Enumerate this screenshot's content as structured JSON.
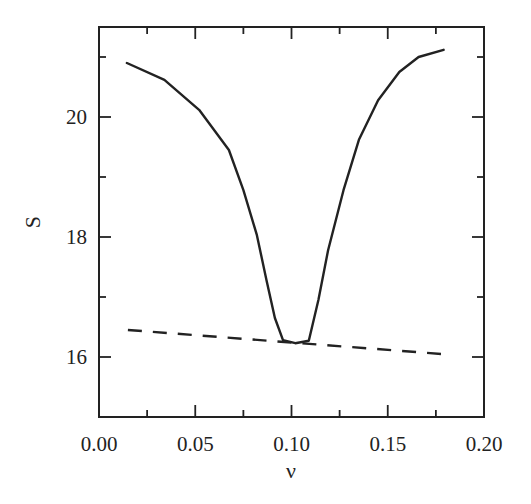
{
  "chart_data": {
    "type": "line",
    "title": "",
    "xlabel": "ν",
    "ylabel": "S",
    "xlim": [
      0.0,
      0.2
    ],
    "ylim": [
      15.0,
      21.5
    ],
    "x_ticks_major": [
      0.0,
      0.05,
      0.1,
      0.15,
      0.2
    ],
    "x_tick_labels": [
      "0.00",
      "0.05",
      "0.10",
      "0.15",
      "0.20"
    ],
    "x_ticks_minor": [
      0.025,
      0.075,
      0.125,
      0.175
    ],
    "y_ticks_major": [
      16,
      18,
      20
    ],
    "y_tick_labels": [
      "16",
      "18",
      "20"
    ],
    "y_ticks_minor": [
      17,
      19,
      21
    ],
    "grid": false,
    "legend": null,
    "series": [
      {
        "name": "solid curve",
        "style": "solid",
        "x": [
          0.0145,
          0.034,
          0.052,
          0.0675,
          0.075,
          0.082,
          0.087,
          0.0914,
          0.0956,
          0.102,
          0.109,
          0.114,
          0.119,
          0.127,
          0.135,
          0.145,
          0.156,
          0.166,
          0.179
        ],
        "y": [
          20.9,
          20.62,
          20.12,
          19.45,
          18.78,
          18.03,
          17.28,
          16.65,
          16.28,
          16.23,
          16.27,
          16.95,
          17.78,
          18.78,
          19.62,
          20.28,
          20.75,
          21.0,
          21.12
        ]
      },
      {
        "name": "dashed line",
        "style": "dashed",
        "x": [
          0.015,
          0.178
        ],
        "y": [
          16.45,
          16.05
        ]
      }
    ]
  },
  "layout": {
    "plot_left": 99,
    "plot_right": 484,
    "plot_top": 27,
    "plot_bottom": 417
  }
}
